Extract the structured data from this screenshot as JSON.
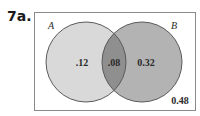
{
  "problem": {
    "label": "7a."
  },
  "diagram": {
    "type": "venn",
    "sets": [
      {
        "name": "A",
        "label": "A",
        "only_value": ".12"
      },
      {
        "name": "B",
        "label": "B",
        "only_value": "0.32"
      }
    ],
    "intersection_value": ".08",
    "outside_value": "0.48",
    "colors": {
      "border": "#8a8a8a",
      "circle_a_fill": "#d9d9d9",
      "circle_b_fill": "#b3b3b3",
      "intersection_fill": "#8f8f8f",
      "circle_stroke": "#5a5a5a",
      "background": "#ffffff"
    }
  }
}
